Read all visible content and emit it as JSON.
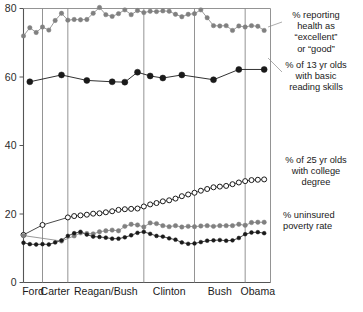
{
  "chart_data": {
    "type": "line",
    "title": "",
    "xlabel": "",
    "ylabel": "",
    "ylim": [
      0,
      80
    ],
    "xlim": [
      1974,
      2013
    ],
    "yticks": [
      0,
      20,
      40,
      60,
      80
    ],
    "grid": false,
    "legend_position": "right-inline-annotations",
    "era_dividers": [
      1977,
      1981,
      1993,
      2001,
      2009
    ],
    "categories": [
      "Ford",
      "Carter",
      "Reagan/Bush",
      "Clinton",
      "Bush",
      "Obama"
    ],
    "era_spans": [
      {
        "label": "Ford",
        "start": 1974,
        "end": 1977
      },
      {
        "label": "Carter",
        "start": 1977,
        "end": 1981
      },
      {
        "label": "Reagan/Bush",
        "start": 1981,
        "end": 1993
      },
      {
        "label": "Clinton",
        "start": 1993,
        "end": 2001
      },
      {
        "label": "Bush",
        "start": 2001,
        "end": 2009
      },
      {
        "label": "Obama",
        "start": 2009,
        "end": 2013
      }
    ],
    "series": [
      {
        "name": "% reporting health as \"excellent\" or \"good\"",
        "marker": "filled-circle",
        "color": "#808080",
        "x": [
          1974,
          1975,
          1976,
          1977,
          1978,
          1979,
          1980,
          1981,
          1982,
          1983,
          1984,
          1985,
          1986,
          1987,
          1988,
          1989,
          1990,
          1991,
          1992,
          1993,
          1994,
          1995,
          1996,
          1997,
          1998,
          1999,
          2000,
          2001,
          2002,
          2003,
          2004,
          2005,
          2006,
          2007,
          2008,
          2009,
          2010,
          2011,
          2012
        ],
        "values": [
          72.0,
          74.4,
          73.0,
          74.6,
          73.7,
          76.5,
          78.6,
          76.6,
          76.8,
          76.7,
          76.8,
          78.6,
          80.3,
          78.2,
          77.7,
          78.5,
          79.6,
          78.2,
          79.4,
          78.8,
          79.2,
          79.1,
          79.3,
          79.2,
          78.3,
          77.6,
          78.3,
          78.5,
          79.6,
          77.3,
          75.0,
          74.9,
          75.0,
          73.6,
          74.9,
          74.6,
          75.0,
          74.8,
          73.6
        ]
      },
      {
        "name": "% of 13 yr olds with basic reading skills",
        "marker": "filled-circle-large",
        "color": "#1a1a1a",
        "x": [
          1975,
          1980,
          1984,
          1988,
          1990,
          1992,
          1994,
          1996,
          1999,
          2004,
          2008,
          2012
        ],
        "values": [
          58.6,
          60.6,
          59.0,
          58.6,
          58.5,
          61.4,
          60.3,
          59.7,
          60.6,
          59.2,
          62.2,
          62.2
        ]
      },
      {
        "name": "% of 25 yr olds with college degree",
        "marker": "open-circle",
        "color": "#1a1a1a",
        "x": [
          1974,
          1977,
          1981,
          1982,
          1983,
          1984,
          1985,
          1986,
          1987,
          1988,
          1989,
          1990,
          1991,
          1992,
          1993,
          1994,
          1995,
          1996,
          1997,
          1998,
          1999,
          2000,
          2001,
          2002,
          2003,
          2004,
          2005,
          2006,
          2007,
          2008,
          2009,
          2010,
          2011,
          2012
        ],
        "values": [
          13.9,
          16.8,
          19.0,
          19.4,
          19.6,
          19.8,
          20.1,
          20.2,
          20.5,
          20.8,
          21.2,
          21.4,
          21.5,
          21.6,
          22.2,
          22.8,
          23.2,
          23.7,
          24.0,
          24.5,
          25.2,
          25.7,
          26.2,
          26.8,
          27.3,
          27.8,
          28.0,
          28.2,
          28.7,
          29.2,
          29.6,
          29.9,
          30.0,
          30.1
        ]
      },
      {
        "name": "% uninsured",
        "marker": "filled-circle",
        "color": "#808080",
        "x": [
          1974,
          1980,
          1982,
          1983,
          1984,
          1985,
          1986,
          1987,
          1988,
          1989,
          1990,
          1991,
          1992,
          1993,
          1994,
          1995,
          1996,
          1997,
          1998,
          1999,
          2000,
          2001,
          2002,
          2003,
          2004,
          2005,
          2006,
          2007,
          2008,
          2009,
          2010,
          2011,
          2012
        ],
        "values": [
          13.7,
          12.1,
          13.6,
          14.5,
          14.3,
          14.2,
          14.8,
          15.1,
          15.3,
          15.1,
          16.4,
          17.0,
          16.8,
          16.2,
          17.4,
          17.2,
          16.6,
          16.3,
          16.6,
          16.2,
          16.4,
          16.3,
          16.5,
          16.6,
          16.4,
          16.6,
          16.6,
          16.6,
          17.0,
          16.7,
          17.5,
          17.6,
          17.6
        ]
      },
      {
        "name": "poverty rate",
        "marker": "filled-circle-small",
        "color": "#1a1a1a",
        "x": [
          1974,
          1975,
          1976,
          1977,
          1978,
          1979,
          1980,
          1981,
          1982,
          1983,
          1984,
          1985,
          1986,
          1987,
          1988,
          1989,
          1990,
          1991,
          1992,
          1993,
          1994,
          1995,
          1996,
          1997,
          1998,
          1999,
          2000,
          2001,
          2002,
          2003,
          2004,
          2005,
          2006,
          2007,
          2008,
          2009,
          2010,
          2011,
          2012
        ],
        "values": [
          11.6,
          11.2,
          11.1,
          11.2,
          11.1,
          11.7,
          12.3,
          13.6,
          14.4,
          14.8,
          14.0,
          13.4,
          13.3,
          13.1,
          12.8,
          12.8,
          13.2,
          13.8,
          14.5,
          14.8,
          14.2,
          13.6,
          13.4,
          12.9,
          12.5,
          11.7,
          11.3,
          11.4,
          11.8,
          12.2,
          12.3,
          12.4,
          12.2,
          12.3,
          13.0,
          14.1,
          14.6,
          14.7,
          14.4
        ]
      }
    ],
    "annotations": [
      {
        "id": "annot-health",
        "lines": [
          "% reporting",
          "health as",
          "“excellent”",
          "or  “good”"
        ]
      },
      {
        "id": "annot-reading",
        "lines": [
          "% of 13 yr olds",
          "with basic",
          "reading skills"
        ]
      },
      {
        "id": "annot-college",
        "lines": [
          "% of 25 yr olds",
          "with college",
          "degree"
        ]
      },
      {
        "id": "annot-uninsured",
        "lines": [
          "% uninsured"
        ]
      },
      {
        "id": "annot-poverty",
        "lines": [
          "poverty rate"
        ]
      }
    ],
    "colors": {
      "gray_series": "#808080",
      "black_series": "#1a1a1a",
      "axis": "#555555",
      "divider": "#888888",
      "background": "#ffffff"
    }
  }
}
